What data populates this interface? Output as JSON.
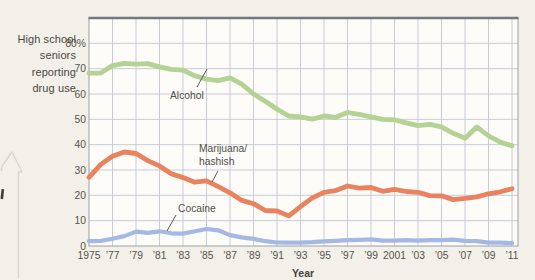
{
  "figure": {
    "y_axis_title_lines": [
      "High school",
      "seniors",
      "reporting",
      "drug use"
    ],
    "x_axis_label": "Year",
    "y_tick_labels": [
      "80%",
      "70",
      "60",
      "50",
      "40",
      "30",
      "20",
      "10",
      "0"
    ],
    "y_tick_values": [
      80,
      70,
      60,
      50,
      40,
      30,
      20,
      10,
      0
    ],
    "x_tick_labels": [
      "1975",
      "’77",
      "’79",
      "’81",
      "’83",
      "’85",
      "’87",
      "’89",
      "’91",
      "’93",
      "’95",
      "’97",
      "’99",
      "2001",
      "’03",
      "’05",
      "’07",
      "’09",
      "’11"
    ],
    "x_tick_years": [
      1975,
      1977,
      1979,
      1981,
      1983,
      1985,
      1987,
      1989,
      1991,
      1993,
      1995,
      1997,
      1999,
      2001,
      2003,
      2005,
      2007,
      2009,
      2011
    ],
    "annotations": {
      "alcohol_label": "Alcohol",
      "marijuana_label_line1": "Marijuana/",
      "marijuana_label_line2": "hashish",
      "cocaine_label": "Cocaine"
    }
  },
  "chart_data": {
    "type": "line",
    "title": "",
    "xlabel": "Year",
    "ylabel": "High school seniors reporting drug use",
    "xlim": [
      1975,
      2011.5
    ],
    "ylim": [
      0,
      90
    ],
    "grid": {
      "x_step_years": 2,
      "y_step": 10,
      "visible": true
    },
    "legend": "inline-annotations",
    "x": [
      1975,
      1976,
      1977,
      1978,
      1979,
      1980,
      1981,
      1982,
      1983,
      1984,
      1985,
      1986,
      1987,
      1988,
      1989,
      1990,
      1991,
      1992,
      1993,
      1994,
      1995,
      1996,
      1997,
      1998,
      1999,
      2000,
      2001,
      2002,
      2003,
      2004,
      2005,
      2006,
      2007,
      2008,
      2009,
      2010,
      2011
    ],
    "series": [
      {
        "name": "Alcohol",
        "color": "#b3d294",
        "values": [
          68.2,
          68.3,
          71.2,
          72.1,
          71.8,
          72,
          70.7,
          69.7,
          69.4,
          67.2,
          65.9,
          65.3,
          66.4,
          63.9,
          60,
          57.1,
          54,
          51.3,
          51,
          50.1,
          51.3,
          50.8,
          52.7,
          52,
          51,
          50,
          49.8,
          48.6,
          47.5,
          48,
          47,
          44.5,
          42.5,
          47,
          43.5,
          41,
          39.5
        ]
      },
      {
        "name": "Marijuana/hashish",
        "color": "#e8825f",
        "values": [
          27.1,
          32.2,
          35.4,
          37.1,
          36.5,
          33.7,
          31.6,
          28.5,
          27,
          25.2,
          25.7,
          23.4,
          21,
          18,
          16.7,
          14,
          13.8,
          11.9,
          15.5,
          19,
          21.2,
          21.9,
          23.7,
          22.8,
          23.1,
          21.6,
          22.4,
          21.5,
          21.2,
          19.9,
          19.8,
          18.3,
          18.8,
          19.4,
          20.6,
          21.4,
          22.6
        ]
      },
      {
        "name": "Cocaine",
        "color": "#a4b8e4",
        "values": [
          1.9,
          2,
          2.9,
          3.9,
          5.7,
          5.2,
          5.8,
          5,
          4.9,
          5.8,
          6.7,
          6.2,
          4.3,
          3.4,
          2.8,
          1.9,
          1.4,
          1.3,
          1.3,
          1.5,
          1.8,
          2,
          2.3,
          2.4,
          2.6,
          2.1,
          2.1,
          2.3,
          2.1,
          2.3,
          2.3,
          2.5,
          2,
          1.9,
          1.3,
          1.3,
          1.1
        ]
      }
    ],
    "style": {
      "page_bg": "#f2f0e9",
      "plot_bg": "#fdfcf9",
      "grid_color": "#c7ccd5",
      "border_color": "#9aa0a8",
      "border_top_color": "#74787e",
      "tick_text_color": "#565349",
      "annotation_text_color": "#504e48",
      "pointer_color": "#5c5a54",
      "edge_outline_color": "#dad7cf",
      "page_mark_color": "#3f3d39"
    }
  }
}
